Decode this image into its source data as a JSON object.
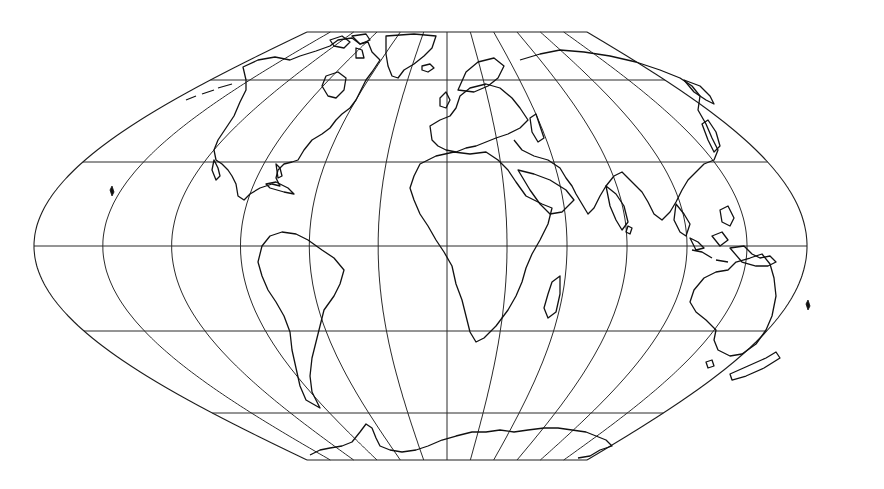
{
  "map": {
    "title": "World map on a pseudoconic (sinusoidal-like) projection with graticule",
    "projection_type": "pseudo-sinusoidal interrupted-free world projection",
    "background_color": "#ffffff",
    "line_color": "#1e1e1e",
    "frame": {
      "center_x": 447,
      "equator_y": 246,
      "left_extreme_x": 34,
      "right_extreme_x": 807,
      "top_edge_y": 32,
      "bottom_edge_y": 460,
      "top_edge_x_range": [
        307,
        587
      ],
      "bottom_edge_x_range": [
        307,
        587
      ]
    },
    "graticule": {
      "parallels_y": [
        32,
        80,
        162,
        246,
        331,
        413,
        460
      ],
      "parallel_labels": [
        "pole-line N",
        "60N",
        "30N",
        "0",
        "30S",
        "60S",
        "pole-line S"
      ],
      "meridian_count_west": 6,
      "meridian_count_east": 6,
      "meridian_spacing_deg": 30
    },
    "landmasses": [
      "North America",
      "Greenland",
      "South America",
      "Europe",
      "Africa",
      "Asia",
      "Australia",
      "Antarctica",
      "Madagascar",
      "New Zealand",
      "Japan",
      "Indonesia",
      "Arctic Archipelago"
    ]
  }
}
